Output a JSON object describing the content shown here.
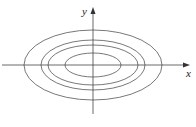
{
  "diagram": {
    "type": "level-curves",
    "axes": {
      "x_label": "x",
      "y_label": "y"
    },
    "stroke_color": "#555555",
    "ellipses": [
      {
        "rx": 69,
        "ry": 35
      },
      {
        "rx": 52,
        "ry": 25
      },
      {
        "rx": 45,
        "ry": 20
      },
      {
        "rx": 28,
        "ry": 12
      }
    ]
  }
}
